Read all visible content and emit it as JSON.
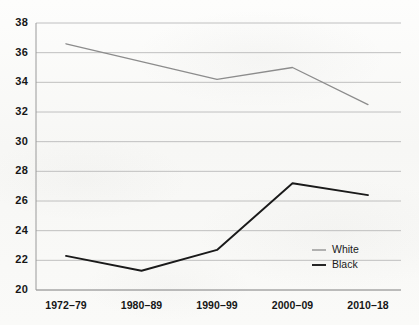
{
  "chart_data": {
    "type": "line",
    "title": "",
    "subtitle": "",
    "xlabel": "",
    "ylabel": "",
    "categories": [
      "1972–79",
      "1980–89",
      "1990–99",
      "2000–09",
      "2010–18"
    ],
    "series": [
      {
        "name": "White",
        "color": "#8c8c8c",
        "values": [
          36.6,
          35.4,
          34.2,
          35.0,
          32.5
        ]
      },
      {
        "name": "Black",
        "color": "#1a1a1a",
        "values": [
          22.3,
          21.3,
          22.7,
          27.2,
          26.4
        ]
      }
    ],
    "ylim": [
      20,
      38
    ],
    "ytick_step": 2,
    "ytick_labels": [
      "38",
      "36",
      "34",
      "32",
      "30",
      "28",
      "26",
      "24",
      "22",
      "20"
    ],
    "grid": true,
    "grid_axis": "y",
    "legend_position": "bottom-right-inside",
    "axis_line_color": "#9a9a9a",
    "grid_color": "#b9b9b9",
    "background_color": "#fbfbfa"
  },
  "legend": {
    "entries": [
      {
        "label": "White",
        "swatch": "white-line-swatch"
      },
      {
        "label": "Black",
        "swatch": "black-line-swatch"
      }
    ]
  }
}
